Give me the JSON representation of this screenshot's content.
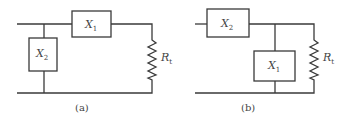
{
  "diagrams": [
    {
      "caption": "(a)",
      "components": {
        "series": {
          "name": "X",
          "sub": "1"
        },
        "shunt": {
          "name": "X",
          "sub": "2"
        },
        "load": {
          "name": "R",
          "sub": "t"
        }
      }
    },
    {
      "caption": "(b)",
      "components": {
        "series": {
          "name": "X",
          "sub": "2"
        },
        "shunt": {
          "name": "X",
          "sub": "1"
        },
        "load": {
          "name": "R",
          "sub": "t"
        }
      }
    }
  ],
  "colors": {
    "line": "#3a3a3a",
    "text": "#444444",
    "background": "#ffffff"
  }
}
